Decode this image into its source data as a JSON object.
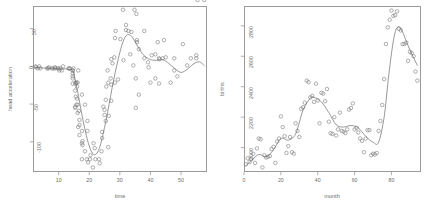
{
  "figure": {
    "background": "#ffffff",
    "point_color": "#7d7d7d",
    "line_color": "#6f6f6f",
    "axis_color": "#9a9a96",
    "text_color": "#6b6b6b"
  },
  "chart_data": [
    {
      "type": "scatter",
      "panel": "left",
      "title": "",
      "xlabel": "time",
      "ylabel": "head acceleration",
      "xlim": [
        1.6,
        58.5
      ],
      "ylim": [
        -140,
        80
      ],
      "xticks": [
        10,
        20,
        30,
        40,
        50
      ],
      "yticks": [
        -100,
        -50,
        0,
        50
      ],
      "grid": false,
      "legend": "none",
      "marker": "open-circle",
      "series": [
        {
          "name": "observations",
          "x": [
            2.4,
            2.6,
            3.2,
            3.6,
            4.0,
            6.2,
            6.6,
            6.8,
            7.8,
            8.2,
            8.8,
            8.8,
            9.6,
            10.0,
            10.2,
            10.6,
            11.0,
            11.4,
            13.2,
            13.6,
            13.6,
            14.6,
            14.6,
            14.6,
            14.6,
            14.6,
            14.6,
            14.8,
            15.4,
            15.4,
            15.4,
            15.4,
            15.6,
            15.6,
            15.8,
            15.8,
            16.0,
            16.0,
            16.2,
            16.2,
            16.2,
            16.4,
            16.4,
            16.6,
            16.8,
            16.8,
            16.8,
            17.6,
            17.6,
            17.6,
            17.6,
            17.8,
            17.8,
            18.6,
            18.6,
            19.2,
            19.4,
            19.4,
            19.6,
            20.2,
            20.4,
            21.2,
            21.4,
            21.8,
            22.0,
            23.2,
            23.4,
            24.0,
            24.2,
            24.2,
            24.6,
            25.0,
            25.0,
            25.4,
            25.4,
            25.6,
            26.0,
            26.2,
            26.2,
            26.4,
            27.0,
            27.2,
            27.2,
            27.2,
            27.6,
            28.2,
            28.4,
            28.4,
            28.6,
            29.4,
            30.2,
            31.0,
            31.2,
            32.0,
            32.0,
            32.8,
            33.4,
            33.8,
            34.4,
            34.8,
            35.2,
            35.2,
            35.4,
            35.6,
            35.6,
            36.2,
            36.2,
            38.0,
            38.0,
            39.2,
            39.4,
            40.0,
            40.4,
            41.6,
            41.6,
            42.4,
            42.8,
            42.8,
            43.0,
            44.0,
            44.4,
            45.0,
            46.6,
            47.8,
            47.8,
            48.8,
            50.6,
            52.0,
            53.2,
            55.0,
            55.0,
            55.4,
            57.6
          ],
          "y": [
            0.0,
            -1.3,
            -2.7,
            0.0,
            -2.7,
            -2.7,
            -2.7,
            -1.3,
            -2.7,
            -2.7,
            -1.3,
            -2.7,
            -2.7,
            -2.7,
            -5.4,
            -2.7,
            -5.4,
            0.0,
            -2.7,
            -2.7,
            -2.7,
            -13.3,
            -5.4,
            -5.4,
            -9.3,
            -16.0,
            -22.8,
            -2.7,
            -22.8,
            -32.1,
            -53.5,
            -54.9,
            -40.2,
            -21.5,
            -21.5,
            -50.8,
            -42.9,
            -26.8,
            -21.5,
            -50.8,
            -61.7,
            -5.4,
            -80.4,
            -59.0,
            -71.0,
            -91.1,
            -77.7,
            -37.5,
            -85.6,
            -123.1,
            -101.9,
            -99.1,
            -104.4,
            -112.5,
            -50.8,
            -123.1,
            -85.6,
            -72.3,
            -127.2,
            -123.1,
            -117.9,
            -134.0,
            -101.9,
            -108.4,
            -123.1,
            -123.1,
            -128.5,
            -112.5,
            -95.1,
            -86.9,
            -53.5,
            -64.4,
            -57.6,
            -72.3,
            -44.3,
            -26.8,
            -5.4,
            -107.1,
            -21.5,
            -65.6,
            -16.0,
            -45.6,
            -24.2,
            9.5,
            4.0,
            12.0,
            -21.5,
            37.5,
            46.9,
            -17.4,
            36.2,
            75.0,
            8.1,
            54.9,
            48.2,
            46.9,
            16.0,
            45.6,
            1.3,
            75.0,
            -16.0,
            -54.9,
            69.6,
            34.8,
            32.1,
            -37.5,
            22.8,
            46.9,
            10.7,
            5.4,
            -1.3,
            -21.5,
            14.7,
            -16.0,
            16.0,
            32.1,
            10.7,
            -22.8,
            9.5,
            10.7,
            34.8,
            12.0,
            -21.5,
            10.7,
            -5.4,
            -13.3,
            29.4,
            1.3,
            10.7,
            14.7,
            10.7
          ]
        },
        {
          "name": "smooth-fit",
          "x": [
            2.4,
            5,
            8,
            11,
            13,
            14.6,
            15.5,
            16.5,
            17.5,
            18.5,
            19.5,
            20.5,
            21.5,
            22.5,
            23.5,
            24.5,
            25.5,
            26.5,
            27.5,
            28.5,
            29.5,
            30.5,
            31.5,
            32.5,
            33.5,
            34.5,
            35.5,
            36.5,
            38,
            40,
            42,
            44,
            46,
            48,
            50,
            52,
            54,
            56,
            57.6
          ],
          "y": [
            -1.5,
            -2.2,
            -2.8,
            -3.2,
            -3.8,
            -6.0,
            -20.0,
            -40.0,
            -62.0,
            -82.0,
            -99.0,
            -111.0,
            -117.0,
            -115.0,
            -106.0,
            -90.0,
            -71.0,
            -50.0,
            -28.0,
            -8.0,
            10.0,
            26.0,
            37.0,
            42.0,
            41.0,
            36.0,
            29.0,
            22.0,
            14.0,
            9.0,
            8.0,
            9.0,
            4.0,
            -3.0,
            -8.0,
            -4.0,
            3.0,
            6.0,
            1.0
          ]
        }
      ]
    },
    {
      "type": "scatter",
      "panel": "right",
      "title": "",
      "xlabel": "month",
      "ylabel": "births",
      "xlim": [
        0,
        96
      ],
      "ylim": [
        1840,
        2930
      ],
      "xticks": [
        0,
        20,
        40,
        60,
        80
      ],
      "yticks": [
        2000,
        2200,
        2400,
        2600,
        2800
      ],
      "grid": false,
      "legend": "none",
      "marker": "open-circle",
      "series": [
        {
          "name": "observations",
          "x": [
            1,
            2,
            3,
            4,
            5,
            6,
            7,
            8,
            9,
            10,
            11,
            12,
            13,
            14,
            15,
            16,
            17,
            18,
            19,
            20,
            21,
            22,
            23,
            24,
            25,
            26,
            27,
            28,
            29,
            30,
            31,
            32,
            33,
            34,
            35,
            36,
            37,
            38,
            39,
            40,
            41,
            42,
            43,
            44,
            45,
            46,
            47,
            48,
            49,
            50,
            51,
            52,
            53,
            54,
            55,
            56,
            57,
            58,
            59,
            60,
            61,
            62,
            63,
            64,
            65,
            66,
            67,
            68,
            69,
            70,
            71,
            72,
            73,
            74,
            75,
            76,
            77,
            78,
            79,
            80,
            81,
            82,
            83,
            84,
            85,
            86,
            87,
            88,
            89,
            90,
            91,
            92,
            93,
            94
          ],
          "y": [
            1890,
            1930,
            1905,
            1925,
            1960,
            1900,
            1995,
            2060,
            2055,
            1870,
            1950,
            1935,
            1940,
            1945,
            1990,
            2005,
            1900,
            2040,
            2060,
            2205,
            2135,
            2075,
            1965,
            2010,
            2070,
            1970,
            1960,
            2160,
            2110,
            2070,
            2255,
            2265,
            2295,
            2440,
            2430,
            2330,
            2340,
            2300,
            2420,
            2310,
            2160,
            2360,
            2355,
            2305,
            2385,
            2170,
            2095,
            2090,
            2200,
            2080,
            2120,
            2230,
            2110,
            2105,
            2095,
            2120,
            2250,
            2260,
            2290,
            2120,
            2130,
            2100,
            2060,
            2045,
            1970,
            2060,
            2115,
            2115,
            1950,
            1960,
            1955,
            1965,
            2110,
            2175,
            2280,
            2450,
            2680,
            2790,
            2840,
            2900,
            2865,
            2870,
            2895,
            2780,
            2770,
            2680,
            2680,
            2690,
            2570,
            2630,
            2620,
            2600,
            2500,
            2440
          ]
        },
        {
          "name": "smooth-fit",
          "x": [
            1,
            4,
            8,
            12,
            16,
            20,
            24,
            28,
            32,
            36,
            38,
            42,
            46,
            50,
            54,
            58,
            62,
            66,
            70,
            73,
            76,
            78,
            80,
            82,
            84,
            86,
            88,
            90,
            92,
            94
          ],
          "y": [
            1880,
            1915,
            1955,
            1940,
            1985,
            2060,
            2050,
            2090,
            2245,
            2325,
            2330,
            2300,
            2230,
            2150,
            2135,
            2145,
            2130,
            2075,
            2035,
            2035,
            2200,
            2420,
            2620,
            2760,
            2795,
            2760,
            2700,
            2640,
            2590,
            2540
          ]
        }
      ]
    }
  ]
}
